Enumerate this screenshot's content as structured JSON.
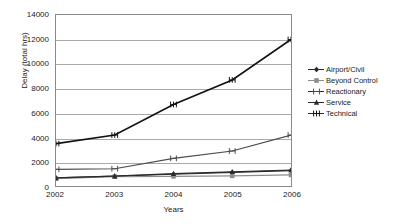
{
  "chart_data": {
    "type": "line",
    "title": "",
    "xlabel": "Years",
    "ylabel": "Delay (total hrs)",
    "categories": [
      "2002",
      "2003",
      "2004",
      "2005",
      "2006"
    ],
    "x": [
      2002,
      2003,
      2004,
      2005,
      2006
    ],
    "ylim": [
      0,
      14000
    ],
    "xlim": [
      2002,
      2006
    ],
    "yticks": [
      0,
      2000,
      4000,
      6000,
      8000,
      10000,
      12000,
      14000
    ],
    "ytick_labels": [
      "0",
      "2000",
      "4000",
      "6000",
      "8000",
      "10000",
      "12000",
      "14000"
    ],
    "grid": "horizontal",
    "legend_position": "right",
    "series": [
      {
        "name": "Airport/Civil",
        "marker": "diamond",
        "color": "#2b2b2b",
        "values": [
          700,
          850,
          1000,
          1150,
          1300
        ]
      },
      {
        "name": "Beyond Control",
        "marker": "square",
        "color": "#8d8d8d",
        "values": [
          650,
          800,
          830,
          870,
          950
        ]
      },
      {
        "name": "Reactionary",
        "marker": "cross",
        "color": "#4a4a4a",
        "values": [
          1400,
          1450,
          2300,
          2900,
          4200
        ]
      },
      {
        "name": "Service",
        "marker": "triangle",
        "color": "#2b2b2b",
        "values": [
          700,
          850,
          1050,
          1200,
          1350
        ]
      },
      {
        "name": "Technical",
        "marker": "asterisk",
        "color": "#111111",
        "values": [
          3500,
          4200,
          6700,
          8700,
          12000
        ]
      }
    ]
  },
  "axes": {
    "y_title": "Delay (total hrs)",
    "x_title": "Years"
  }
}
